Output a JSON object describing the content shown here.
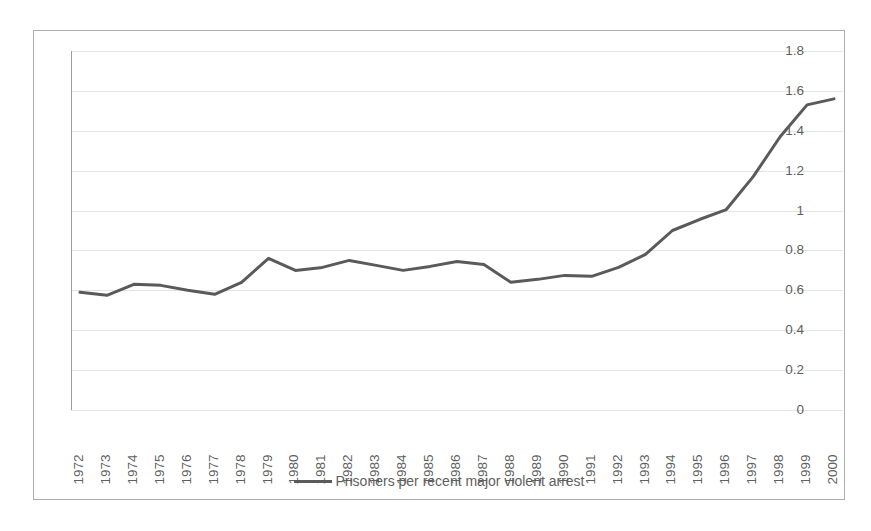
{
  "chart_data": {
    "type": "line",
    "title": "",
    "xlabel": "",
    "ylabel": "",
    "grid": true,
    "legend_position": "bottom",
    "ylim": [
      0,
      1.8
    ],
    "yticks": [
      "0",
      "0.2",
      "0.4",
      "0.6",
      "0.8",
      "1",
      "1.2",
      "1.4",
      "1.6",
      "1.8"
    ],
    "ytick_values": [
      0,
      0.2,
      0.4,
      0.6,
      0.8,
      1.0,
      1.2,
      1.4,
      1.6,
      1.8
    ],
    "categories": [
      "1972",
      "1973",
      "1974",
      "1975",
      "1976",
      "1977",
      "1978",
      "1979",
      "1980",
      "1981",
      "1982",
      "1983",
      "1984",
      "1985",
      "1986",
      "1987",
      "1988",
      "1989",
      "1990",
      "1991",
      "1992",
      "1993",
      "1994",
      "1995",
      "1996",
      "1997",
      "1998",
      "1999",
      "2000"
    ],
    "series": [
      {
        "name": "Prisoners per recent major violent arrest",
        "color": "#5a5a5a",
        "values": [
          0.59,
          0.575,
          0.63,
          0.625,
          0.6,
          0.58,
          0.64,
          0.76,
          0.7,
          0.715,
          0.75,
          0.725,
          0.7,
          0.72,
          0.745,
          0.73,
          0.64,
          0.655,
          0.675,
          0.67,
          0.715,
          0.78,
          0.9,
          0.955,
          1.005,
          1.17,
          1.37,
          1.53,
          1.56
        ]
      }
    ],
    "legend": [
      {
        "label": "Prisoners per recent major violent arrest",
        "color": "#5a5a5a"
      }
    ]
  },
  "colors": {
    "series": "#5a5a5a",
    "gridline": "#e4e4e4",
    "axis": "#9c9c9c",
    "frame": "#adadad",
    "text": "#5f5f5f",
    "background": "#ffffff"
  }
}
